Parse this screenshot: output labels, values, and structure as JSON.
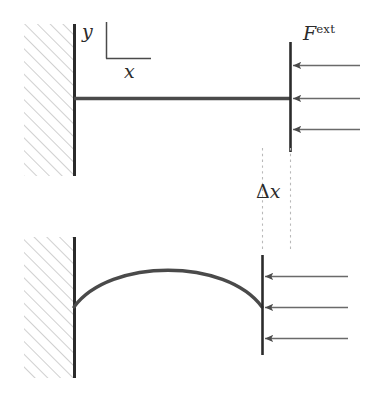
{
  "figure": {
    "width": 368,
    "height": 395,
    "background_color": "#ffffff",
    "ink_color": "#2b2b2b",
    "hatch_color": "#9a9a9a",
    "arrow_color": "#4a4a4a",
    "dashed_color": "#bbbbbb"
  },
  "labels": {
    "force": "F",
    "force_superscript": "ext",
    "axis_y": "y",
    "axis_x": "x",
    "delta_symbol": "Δ",
    "delta_variable": "x"
  },
  "panels": [
    {
      "name": "undeformed-configuration",
      "description": "Straight horizontal beam clamped into a hatched wall on the left, loaded by three leftward external force arrows on the right end.",
      "wall": {
        "x": 24,
        "y": 24,
        "width": 50,
        "height": 152,
        "hatch_angle_deg": 45
      },
      "support_line": {
        "x": 74,
        "y_top": 24,
        "y_bottom": 176
      },
      "beam": {
        "x_start": 74,
        "x_end": 290,
        "y": 98
      },
      "end_plate": {
        "x": 290,
        "y_top": 42,
        "y_bottom": 152
      },
      "arrows": [
        {
          "y": 65,
          "x_tail": 360,
          "x_head": 292,
          "direction": "left"
        },
        {
          "y": 98,
          "x_tail": 360,
          "x_head": 292,
          "direction": "left"
        },
        {
          "y": 129,
          "x_tail": 360,
          "x_head": 292,
          "direction": "left"
        }
      ],
      "axis_marker": {
        "origin_x": 106,
        "origin_y": 58,
        "y_arm_top": 22,
        "x_arm_right": 150
      }
    },
    {
      "name": "deformed-configuration",
      "description": "Buckled beam bowing upward, clamped in the hatched wall on the left; the loaded right end has shifted left by the distance delta x.",
      "wall": {
        "x": 24,
        "y": 237,
        "width": 50,
        "height": 141,
        "hatch_angle_deg": 45
      },
      "support_line": {
        "x": 74,
        "y_top": 237,
        "y_bottom": 378
      },
      "beam_curve": {
        "x_start": 74,
        "y_start": 307,
        "x_peak": 168,
        "y_peak": 268,
        "x_end": 262,
        "y_end": 307
      },
      "end_plate": {
        "x": 262,
        "y_top": 255,
        "y_bottom": 355
      },
      "arrows": [
        {
          "y": 276,
          "x_tail": 348,
          "x_head": 264,
          "direction": "left"
        },
        {
          "y": 307,
          "x_tail": 348,
          "x_head": 264,
          "direction": "left"
        },
        {
          "y": 338,
          "x_tail": 348,
          "x_head": 264,
          "direction": "left"
        }
      ]
    }
  ],
  "dimension": {
    "name": "delta-x-displacement",
    "left_guide_x": 262,
    "right_guide_x": 290,
    "guide_y_top": 148,
    "guide_y_bottom": 250,
    "value_text": "Δx"
  }
}
